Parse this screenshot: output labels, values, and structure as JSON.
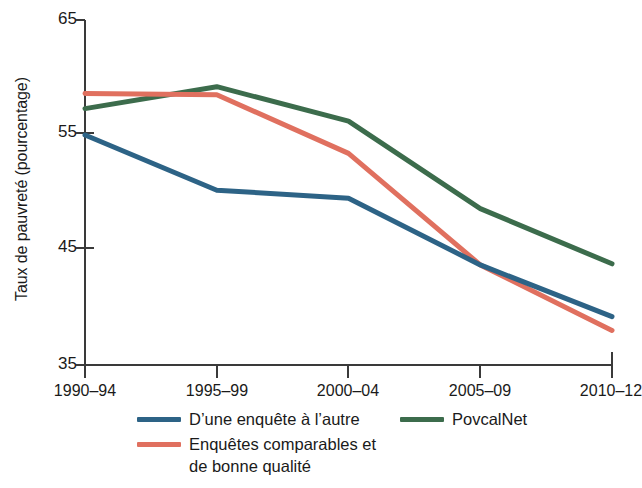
{
  "chart_data": {
    "type": "line",
    "title": "",
    "xlabel": "",
    "ylabel": "Taux de pauvreté (pourcentage)",
    "categories": [
      "1990–94",
      "1995–99",
      "2000–04",
      "2005–09",
      "2010–12"
    ],
    "ylim": [
      35,
      65
    ],
    "yticks": [
      35,
      45,
      55,
      65
    ],
    "ytick_labels": [
      "35",
      "45",
      "55",
      "65"
    ],
    "grid": false,
    "legend_position": "bottom",
    "series": [
      {
        "name": "D’une enquête à l’autre",
        "color": "#2d6386",
        "values": [
          55.0,
          50.2,
          49.5,
          43.7,
          39.2
        ]
      },
      {
        "name": "Enquêtes comparables et de bonne qualité",
        "color": "#e0705f",
        "values": [
          58.6,
          58.5,
          53.4,
          43.7,
          38.0
        ]
      },
      {
        "name": "PovcalNet",
        "color": "#3c6c4c",
        "values": [
          57.3,
          59.2,
          56.2,
          48.6,
          43.8
        ]
      }
    ]
  },
  "axis": {
    "y_title": "Taux de pauvreté (pourcentage)",
    "y_tick_0": "35",
    "y_tick_1": "45",
    "y_tick_2": "55",
    "y_tick_3": "65",
    "x_tick_0": "1990–94",
    "x_tick_1": "1995–99",
    "x_tick_2": "2000–04",
    "x_tick_3": "2005–09",
    "x_tick_4": "2010–12"
  },
  "legend": {
    "blue_label": "D’une enquête à l’autre",
    "green_label": "PovcalNet",
    "red_label": "Enquêtes comparables et\nde bonne qualité",
    "blue_color": "#2d6386",
    "green_color": "#3c6c4c",
    "red_color": "#e0705f"
  }
}
